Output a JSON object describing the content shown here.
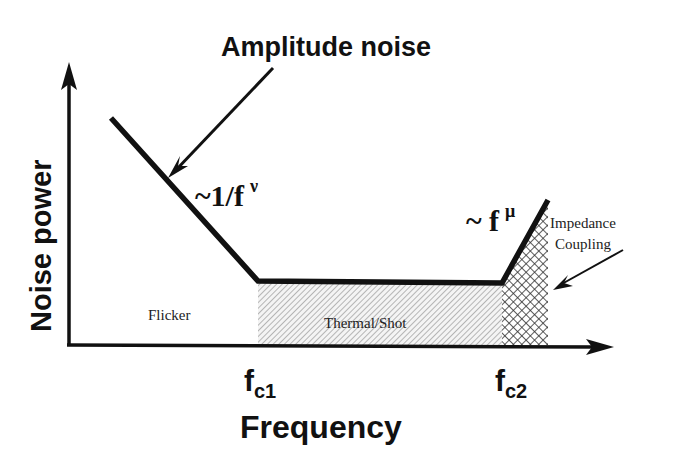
{
  "title": "Amplitude noise",
  "axes": {
    "y_label": "Noise power",
    "x_label": "Frequency"
  },
  "corner_frequencies": {
    "fc1": {
      "main": "f",
      "sub": "c1"
    },
    "fc2": {
      "main": "f",
      "sub": "c2"
    }
  },
  "slopes": {
    "low": {
      "prefix": "~1/f",
      "exp": "ν"
    },
    "high": {
      "prefix": "~ f",
      "exp": "μ"
    }
  },
  "regions": {
    "flicker": "Flicker",
    "thermal": "Thermal/Shot",
    "impedance_line1": "Impedance",
    "impedance_line2": "Coupling"
  },
  "colors": {
    "line": "#111111",
    "hatch": "#9a9a9a",
    "crosshatch": "#333333",
    "background": "#ffffff"
  }
}
